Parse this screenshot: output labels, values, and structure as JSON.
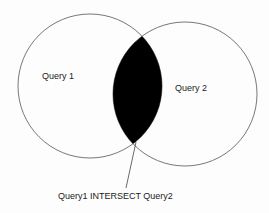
{
  "diagram": {
    "type": "venn",
    "sets": [
      {
        "label": "Query 1"
      },
      {
        "label": "Query 2"
      }
    ],
    "intersection": {
      "label": "Query1 INTERSECT Query2",
      "fill": "#000000"
    }
  }
}
